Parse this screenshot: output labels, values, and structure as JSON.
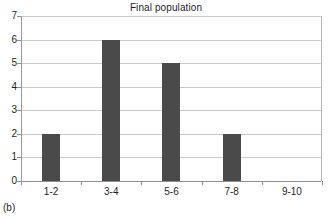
{
  "chart_data": {
    "type": "bar",
    "title": "Final population",
    "xlabel": "",
    "ylabel": "",
    "categories": [
      "1-2",
      "3-4",
      "5-6",
      "7-8",
      "9-10"
    ],
    "values": [
      2,
      6,
      5,
      2,
      0
    ],
    "ylim": [
      0,
      7
    ],
    "ytick_labels": [
      "0",
      "1",
      "2",
      "3",
      "4",
      "5",
      "6",
      "7"
    ],
    "ytick_values": [
      0,
      1,
      2,
      3,
      4,
      5,
      6,
      7
    ],
    "grid": true,
    "legend": false,
    "series": [
      {
        "name": "Final population",
        "values": [
          2,
          6,
          5,
          2,
          0
        ]
      }
    ],
    "bar_color": "#4a4a4a",
    "gridline_color": "#c9c9c9",
    "axis_color": "#8f8f8f",
    "background_color": "#ffffff"
  },
  "figure": {
    "caption": "(b)"
  }
}
